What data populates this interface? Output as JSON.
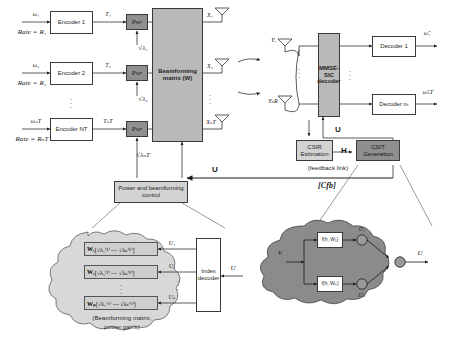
{
  "figure": {
    "type": "block-diagram"
  },
  "transmitter": {
    "streams": [
      {
        "input": "ω₁",
        "rate": "Rate = R₁",
        "encoder": "Encoder 1",
        "stream": "T₁",
        "power": "Pwr",
        "gain": "√λ₁",
        "antenna_out": "X₁"
      },
      {
        "input": "ω₂",
        "rate": "Rate = R₂",
        "encoder": "Encoder 2",
        "stream": "T₂",
        "power": "Pwr",
        "gain": "√λ₂",
        "antenna_out": "X₂"
      },
      {
        "input": "ωₙT",
        "rate": "Rate = RₙT",
        "encoder": "Encoder NT",
        "stream": "TₙT",
        "power": "Pwr",
        "gain": "√λₙT",
        "antenna_out": "XₙT"
      }
    ],
    "beamforming_block": {
      "line1": "Beamforming",
      "line2": "matrix (W)"
    },
    "control_block": {
      "line1": "Power and beamforming",
      "line2": "control"
    },
    "control_input_label": "U"
  },
  "receiver": {
    "antennas": [
      "Y₁",
      "YₙR"
    ],
    "decoder_block": {
      "line1": "MMSE-",
      "line2": "SIC",
      "line3": "decoder"
    },
    "decoder_feedback_label": "U",
    "decoders": [
      {
        "label": "Decoder 1",
        "output": "ω̂₁"
      },
      {
        "label": "Decoder nₜ",
        "output": "ω̂ₙT"
      }
    ]
  },
  "channel_feedback": {
    "csir": {
      "line1": "CSIR",
      "line2": "Estimation"
    },
    "channel_label": "H",
    "csit": {
      "line1": "CSIT",
      "line2": "Generation"
    },
    "feedback_link_label": "(feedback link)",
    "feedback_capacity": "[Cfb]"
  },
  "codebook_cloud": {
    "entries": [
      {
        "matrix": "W₁",
        "gains": "[√λ₁⁽¹⁾ ⋯ √λₙ⁽¹⁾]",
        "index": "U₁"
      },
      {
        "matrix": "W₂",
        "gains": "[√λ₁⁽²⁾ ⋯ √λₙ⁽²⁾]",
        "index": "U₂"
      },
      {
        "matrix": "Wₚ",
        "gains": "[√λ₁⁽ᵖ⁾ ⋯ √λₙ⁽ᵖ⁾]",
        "index": "Uₚ"
      }
    ],
    "decoder_box": {
      "line1": "Index",
      "line2": "decoder"
    },
    "decoder_input": "U",
    "caption_line1": "(Beamforming matrix,",
    "caption_line2": "power gains)"
  },
  "selection_cloud": {
    "input": "V",
    "functions": [
      "f(h, W₁)",
      "f(h, Wₚ)"
    ],
    "nodes": [
      "U₁",
      "Uₚ"
    ],
    "output": "U"
  },
  "palette": {
    "light_gray": "#d3d3d3",
    "mid_gray": "#b9b9b9",
    "dark_gray": "#8f8f8f",
    "cloud_light": "#d8d8d8",
    "cloud_dark": "#8b8b8b",
    "stroke": "#3a3a3a"
  }
}
